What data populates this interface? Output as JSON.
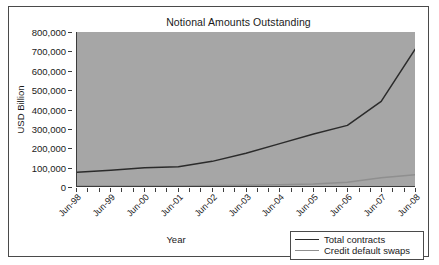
{
  "chart_data": {
    "type": "line",
    "title": "Notional Amounts Outstanding",
    "xlabel": "Year",
    "ylabel": "USD Billion",
    "grid": false,
    "legend_position": "bottom-right",
    "plot_background": "#a6a6a6",
    "x": [
      "Jun-98",
      "Jun-99",
      "Jun-00",
      "Jun-01",
      "Jun-02",
      "Jun-03",
      "Jun-04",
      "Jun-05",
      "Jun-06",
      "Jun-07",
      "Jun-08"
    ],
    "categories": [
      "Jun-98",
      "Jun-99",
      "Jun-00",
      "Jun-01",
      "Jun-02",
      "Jun-03",
      "Jun-04",
      "Jun-05",
      "Jun-06",
      "Jun-07",
      "Jun-08"
    ],
    "xlim": [
      0,
      10
    ],
    "ylim": [
      0,
      800000
    ],
    "ytick_labels": [
      "800,000",
      "700,000",
      "600,000",
      "500,000",
      "400,000",
      "300,000",
      "200,000",
      "100,000",
      "0"
    ],
    "ytick_values": [
      800000,
      700000,
      600000,
      500000,
      400000,
      300000,
      200000,
      100000,
      0
    ],
    "series": [
      {
        "name": "Total contracts",
        "color": "#2b2b2b",
        "values": [
          72000,
          82000,
          95000,
          100000,
          128000,
          170000,
          220000,
          270000,
          315000,
          440000,
          710000
        ]
      },
      {
        "name": "Credit default swaps",
        "color": "#8f8f8f",
        "values": [
          0,
          0,
          0,
          0,
          2000,
          4000,
          6000,
          10000,
          20000,
          43000,
          58000
        ]
      }
    ]
  },
  "legend": {
    "entries": [
      {
        "label": "Total contracts"
      },
      {
        "label": "Credit default swaps"
      }
    ]
  }
}
